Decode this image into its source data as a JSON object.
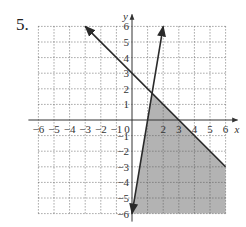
{
  "problem": {
    "number_label": "5."
  },
  "chart_data": {
    "type": "line",
    "title": "",
    "xlabel": "x",
    "ylabel": "y",
    "xlim": [
      -6,
      6
    ],
    "ylim": [
      -6,
      6
    ],
    "grid": true,
    "grid_style": "dotted",
    "x_ticks": [
      -6,
      -5,
      -4,
      -3,
      -2,
      -1,
      0,
      1,
      2,
      3,
      4,
      5,
      6
    ],
    "x_tick_labels": [
      "−6",
      "−5",
      "−4",
      "−3",
      "−2",
      "−1",
      "0",
      "",
      "2",
      "3",
      "4",
      "5",
      "6"
    ],
    "y_ticks": [
      -6,
      -5,
      -4,
      -3,
      -2,
      -1,
      1,
      2,
      3,
      4,
      5,
      6
    ],
    "y_tick_labels": [
      "−6",
      "−5",
      "−4",
      "−3",
      "−2",
      "−1",
      "1",
      "2",
      "3",
      "4",
      "5",
      "6"
    ],
    "series": [
      {
        "name": "line-1",
        "equation": "y = -x + 3",
        "points": [
          [
            -3,
            6
          ],
          [
            6,
            -3
          ]
        ],
        "arrow_at_start": true,
        "arrow_at_end": false
      },
      {
        "name": "line-2",
        "equation": "y = 6x - 6",
        "points": [
          [
            0,
            -6
          ],
          [
            2,
            6
          ]
        ],
        "arrow_at_start": true,
        "arrow_at_end": true
      }
    ],
    "shaded_region": {
      "description": "y <= -x + 3 and y >= 6x - 6, within the grid",
      "vertices": [
        [
          1.2857,
          1.7143
        ],
        [
          6,
          -3
        ],
        [
          6,
          -6
        ],
        [
          0,
          -6
        ]
      ],
      "fill": "#b3b3b3"
    },
    "colors": {
      "line": "#2a2a2a",
      "grid": "#555555",
      "axis": "#333333",
      "shade": "#b3b3b3"
    }
  },
  "layout": {
    "origin_px": [
      132,
      120
    ],
    "unit_px": 15.6
  }
}
